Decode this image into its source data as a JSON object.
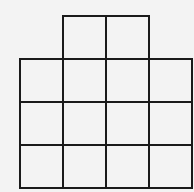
{
  "diagram": {
    "type": "grid-shape",
    "cell_size_px": 43,
    "origin": {
      "x": 20,
      "y": 16
    },
    "line_color": "#1a1a1a",
    "background": "#f3f3f3",
    "cells": [
      {
        "row": 0,
        "col": 1
      },
      {
        "row": 0,
        "col": 2
      },
      {
        "row": 1,
        "col": 0
      },
      {
        "row": 1,
        "col": 1
      },
      {
        "row": 1,
        "col": 2
      },
      {
        "row": 1,
        "col": 3
      },
      {
        "row": 2,
        "col": 0
      },
      {
        "row": 2,
        "col": 1
      },
      {
        "row": 2,
        "col": 2
      },
      {
        "row": 2,
        "col": 3
      },
      {
        "row": 3,
        "col": 0
      },
      {
        "row": 3,
        "col": 1
      },
      {
        "row": 3,
        "col": 2
      },
      {
        "row": 3,
        "col": 3
      }
    ]
  }
}
